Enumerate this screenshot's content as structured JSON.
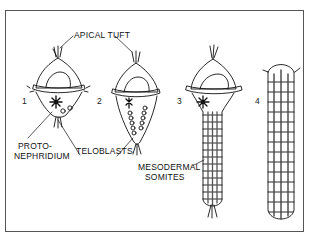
{
  "figure": {
    "labels": {
      "apical_tuft": "APICAL TUFT",
      "protonephridium_line1": "PROTO-",
      "protonephridium_line2": "NEPHRIDIUM",
      "teloblasts": "TELOBLASTS",
      "mesodermal_line1": "MESODERMAL",
      "mesodermal_line2": "SOMITES"
    },
    "stages": [
      {
        "number": "1"
      },
      {
        "number": "2"
      },
      {
        "number": "3"
      },
      {
        "number": "4"
      }
    ],
    "colors": {
      "line": "#111111",
      "frame": "#555555",
      "background": "#ffffff"
    }
  }
}
